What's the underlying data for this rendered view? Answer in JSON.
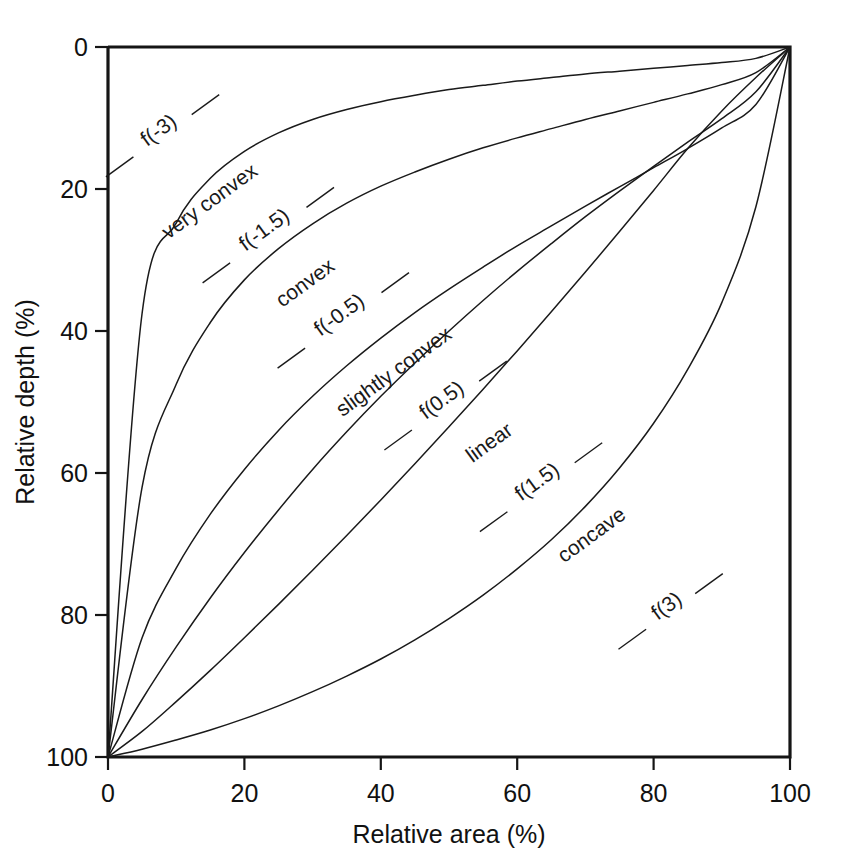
{
  "chart_data": {
    "type": "line",
    "title": "",
    "xlabel": "Relative area (%)",
    "ylabel": "Relative depth (%)",
    "xlim": [
      0,
      100
    ],
    "ylim": [
      100,
      0
    ],
    "y_axis_inverted": true,
    "grid": false,
    "legend": "none",
    "xticks": [
      "0",
      "20",
      "40",
      "60",
      "80",
      "100"
    ],
    "xtick_values": [
      0,
      20,
      40,
      60,
      80,
      100
    ],
    "yticks": [
      "0",
      "20",
      "40",
      "60",
      "80",
      "100"
    ],
    "ytick_values": [
      0,
      20,
      40,
      60,
      80,
      100
    ],
    "x": [
      0,
      5,
      10,
      15,
      20,
      25,
      30,
      35,
      40,
      45,
      50,
      55,
      60,
      65,
      70,
      75,
      80,
      85,
      90,
      95,
      100
    ],
    "series": [
      {
        "name": "f(-3)",
        "shape_label": "very convex",
        "values": [
          100,
          37.5,
          24.8,
          18.5,
          14.7,
          12.1,
          10.2,
          8.8,
          7.7,
          6.8,
          6.0,
          5.4,
          4.8,
          4.3,
          3.8,
          3.4,
          3.0,
          2.6,
          2.2,
          1.6,
          0
        ]
      },
      {
        "name": "f(-1.5)",
        "shape_label": "convex",
        "values": [
          100,
          62.0,
          47.5,
          38.8,
          32.8,
          28.4,
          24.9,
          22.0,
          19.6,
          17.6,
          15.8,
          14.2,
          12.8,
          11.5,
          10.2,
          9.0,
          7.8,
          6.6,
          5.3,
          3.6,
          0
        ]
      },
      {
        "name": "f(-0.5)",
        "shape_label": "slightly convex",
        "values": [
          100,
          83.2,
          73.4,
          65.8,
          59.5,
          54.0,
          49.2,
          44.9,
          41.0,
          37.4,
          34.1,
          31.0,
          28.0,
          25.2,
          22.4,
          19.7,
          17.0,
          14.3,
          11.4,
          8.1,
          0
        ]
      },
      {
        "name": "f(0.5)",
        "shape_label": "linear",
        "values": [
          100,
          91.9,
          84.5,
          77.6,
          71.2,
          65.2,
          59.5,
          54.2,
          49.2,
          44.5,
          40.0,
          35.7,
          31.6,
          27.7,
          23.9,
          20.3,
          16.8,
          13.4,
          10.1,
          6.3,
          0
        ]
      },
      {
        "name": "f(1.5)",
        "shape_label": "concave",
        "values": [
          100,
          96.4,
          92.2,
          87.8,
          83.2,
          78.5,
          73.7,
          68.8,
          63.8,
          58.7,
          53.5,
          48.2,
          42.8,
          37.3,
          31.7,
          26.0,
          20.2,
          14.3,
          9.0,
          4.3,
          0
        ]
      },
      {
        "name": "f(3)",
        "shape_label": "concave",
        "values": [
          100,
          98.9,
          97.6,
          96.2,
          94.6,
          92.8,
          90.8,
          88.6,
          86.2,
          83.5,
          80.5,
          77.2,
          73.5,
          69.4,
          64.7,
          59.3,
          53.0,
          45.4,
          36.0,
          22.5,
          0
        ]
      }
    ],
    "annotations": [
      {
        "text": "f(-3)",
        "x": 8,
        "y": 12.5
      },
      {
        "text": "very convex",
        "x": 15.5,
        "y": 22.5
      },
      {
        "text": "f(-1.5)",
        "x": 23.5,
        "y": 26.5
      },
      {
        "text": "convex",
        "x": 29.5,
        "y": 34.0
      },
      {
        "text": "f(-0.5)",
        "x": 34.5,
        "y": 38.5
      },
      {
        "text": "slightly convex",
        "x": 42.5,
        "y": 46.5
      },
      {
        "text": "f(0.5)",
        "x": 49.5,
        "y": 50.5
      },
      {
        "text": "linear",
        "x": 56.5,
        "y": 56.5
      },
      {
        "text": "f(1.5)",
        "x": 63.5,
        "y": 62.0
      },
      {
        "text": "concave",
        "x": 71.5,
        "y": 69.5
      },
      {
        "text": "f(3)",
        "x": 82.5,
        "y": 79.5
      }
    ]
  }
}
